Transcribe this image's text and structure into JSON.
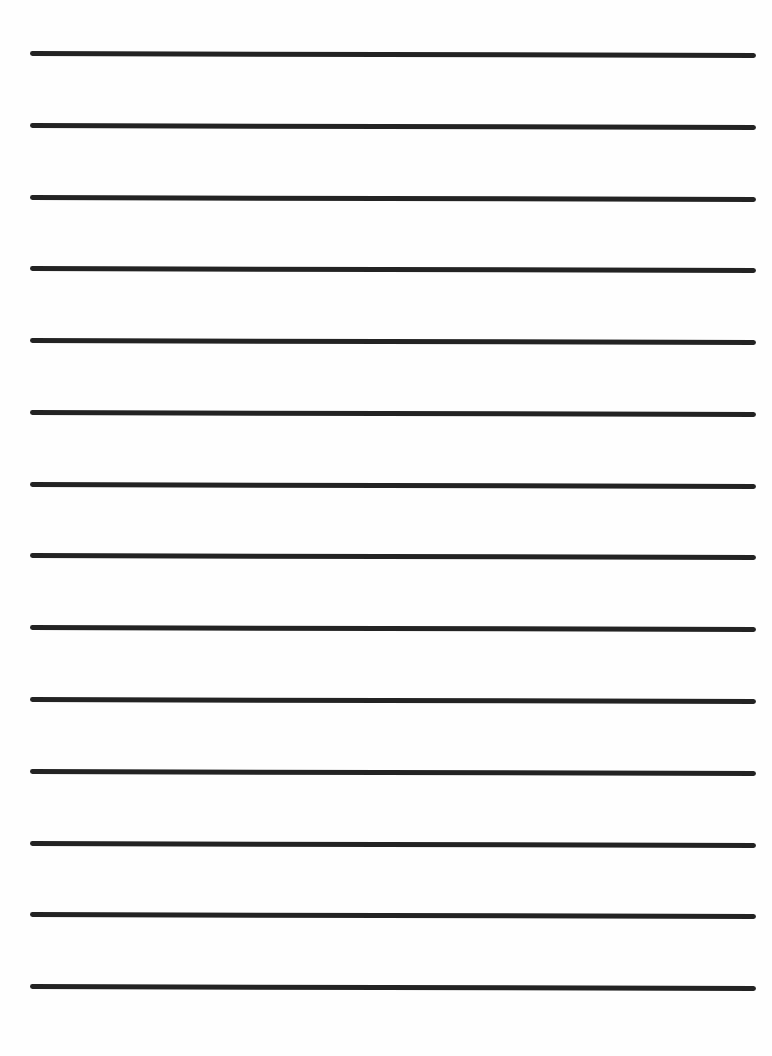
{
  "document": {
    "type": "lined-paper",
    "line_count": 14,
    "line_color": "#232323",
    "background_color": "#fefefe",
    "lines": [
      {
        "y": 51
      },
      {
        "y": 123
      },
      {
        "y": 195
      },
      {
        "y": 266
      },
      {
        "y": 338
      },
      {
        "y": 410
      },
      {
        "y": 482
      },
      {
        "y": 553
      },
      {
        "y": 625
      },
      {
        "y": 697
      },
      {
        "y": 769
      },
      {
        "y": 841
      },
      {
        "y": 912
      },
      {
        "y": 984
      }
    ]
  }
}
